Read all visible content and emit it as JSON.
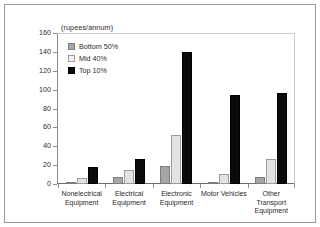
{
  "chart_data": {
    "type": "bar",
    "title": "",
    "subtitle": "",
    "axis_units_label": "(rupees/annum)",
    "xlabel": "",
    "ylabel": "",
    "ylim": [
      0,
      160
    ],
    "ytick_values": [
      0,
      20,
      40,
      60,
      80,
      100,
      120,
      140,
      160
    ],
    "ytick_labels": [
      "0",
      "20",
      "40",
      "60",
      "80",
      "100",
      "120",
      "140",
      "160"
    ],
    "grid": false,
    "legend_position": "top-left-inside",
    "categories": [
      "Nonelectrical Equipment",
      "Electrical Equipment",
      "Electronic Equipment",
      "Motor Vehicles",
      "Other Transport Equipment"
    ],
    "series": [
      {
        "name": "Bottom 50%",
        "color": "#a6a6a6",
        "values": [
          1,
          7,
          19,
          2,
          7
        ]
      },
      {
        "name": "Mid 40%",
        "color": "#e3e3e3",
        "values": [
          6,
          15,
          52,
          11,
          27
        ]
      },
      {
        "name": "Top 10%",
        "color": "#0b0b0b",
        "values": [
          18,
          27,
          140,
          94,
          96
        ]
      }
    ]
  },
  "legend": {
    "items": [
      {
        "label": "Bottom 50%",
        "swatch": "bottom50"
      },
      {
        "label": "Mid 40%",
        "swatch": "mid40"
      },
      {
        "label": "Top 10%",
        "swatch": "top10"
      }
    ]
  }
}
